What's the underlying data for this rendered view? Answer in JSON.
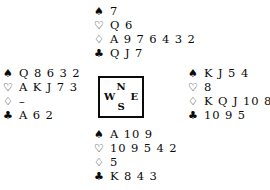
{
  "diagram": {
    "type": "bridge-deal",
    "suit_order": [
      "spades",
      "hearts",
      "diamonds",
      "clubs"
    ],
    "symbols": {
      "spades": "♠",
      "hearts": "♡",
      "diamonds": "♢",
      "clubs": "♣"
    },
    "ink_color": "#0a0a0a",
    "background_color": "#ffffff"
  },
  "compass": {
    "north": "N",
    "west": "W",
    "east": "E",
    "south": "S"
  },
  "hands": {
    "north": {
      "position": "North",
      "spades": "7",
      "hearts": "Q 6",
      "diamonds": "A 9 7 6 4 3 2",
      "clubs": "Q J 7"
    },
    "west": {
      "position": "West",
      "spades": "Q 8 6 3 2",
      "hearts": "A K J 7 3",
      "diamonds": "–",
      "clubs": "A 6 2"
    },
    "east": {
      "position": "East",
      "spades": "K J 5 4",
      "hearts": "8",
      "diamonds": "K Q J 10 8",
      "clubs": "10 9 5"
    },
    "south": {
      "position": "South",
      "spades": "A 10 9",
      "hearts": "10 9 5 4 2",
      "diamonds": "5",
      "clubs": "K 8 4 3"
    }
  }
}
